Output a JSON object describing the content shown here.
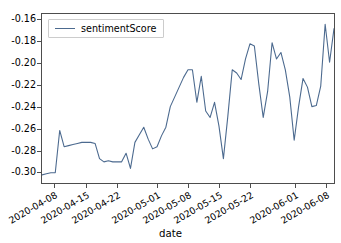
{
  "chart_data": {
    "type": "line",
    "title": "",
    "xlabel": "date",
    "ylabel": "",
    "grid": false,
    "legend_position": "upper left",
    "ylim": [
      -0.3105,
      -0.1545
    ],
    "xlim": [
      "2020-04-05",
      "2020-06-10"
    ],
    "ytick_labels": [
      "-0.16",
      "-0.18",
      "-0.20",
      "-0.22",
      "-0.24",
      "-0.26",
      "-0.28",
      "-0.30"
    ],
    "ytick_values": [
      -0.16,
      -0.18,
      -0.2,
      -0.22,
      -0.24,
      -0.26,
      -0.28,
      -0.3
    ],
    "xtick_labels": [
      "2020-04-08",
      "2020-04-15",
      "2020-04-22",
      "2020-05-01",
      "2020-05-08",
      "2020-05-15",
      "2020-05-22",
      "2020-06-01",
      "2020-06-08"
    ],
    "xtick_dates": [
      "2020-04-08",
      "2020-04-15",
      "2020-04-22",
      "2020-05-01",
      "2020-05-08",
      "2020-05-15",
      "2020-05-22",
      "2020-06-01",
      "2020-06-08"
    ],
    "series": [
      {
        "name": "sentimentScore",
        "color": "#4c6a8f",
        "x": [
          "2020-04-05",
          "2020-04-06",
          "2020-04-07",
          "2020-04-08",
          "2020-04-09",
          "2020-04-10",
          "2020-04-11",
          "2020-04-12",
          "2020-04-13",
          "2020-04-14",
          "2020-04-15",
          "2020-04-16",
          "2020-04-17",
          "2020-04-18",
          "2020-04-19",
          "2020-04-20",
          "2020-04-21",
          "2020-04-22",
          "2020-04-23",
          "2020-04-24",
          "2020-04-25",
          "2020-04-26",
          "2020-04-27",
          "2020-04-28",
          "2020-04-29",
          "2020-04-30",
          "2020-05-01",
          "2020-05-02",
          "2020-05-03",
          "2020-05-04",
          "2020-05-05",
          "2020-05-06",
          "2020-05-07",
          "2020-05-08",
          "2020-05-09",
          "2020-05-10",
          "2020-05-11",
          "2020-05-12",
          "2020-05-13",
          "2020-05-14",
          "2020-05-15",
          "2020-05-16",
          "2020-05-17",
          "2020-05-18",
          "2020-05-19",
          "2020-05-20",
          "2020-05-21",
          "2020-05-22",
          "2020-05-23",
          "2020-05-24",
          "2020-05-25",
          "2020-05-26",
          "2020-05-27",
          "2020-05-28",
          "2020-05-29",
          "2020-05-30",
          "2020-05-31",
          "2020-06-01",
          "2020-06-02",
          "2020-06-03",
          "2020-06-04",
          "2020-06-05",
          "2020-06-06",
          "2020-06-07",
          "2020-06-08",
          "2020-06-09",
          "2020-06-10"
        ],
        "y": [
          -0.303,
          -0.302,
          -0.301,
          -0.301,
          -0.262,
          -0.277,
          -0.276,
          -0.275,
          -0.274,
          -0.273,
          -0.273,
          -0.273,
          -0.274,
          -0.288,
          -0.291,
          -0.29,
          -0.291,
          -0.291,
          -0.291,
          -0.283,
          -0.297,
          -0.273,
          -0.266,
          -0.259,
          -0.27,
          -0.279,
          -0.277,
          -0.267,
          -0.259,
          -0.24,
          -0.231,
          -0.222,
          -0.213,
          -0.206,
          -0.206,
          -0.236,
          -0.212,
          -0.244,
          -0.25,
          -0.236,
          -0.258,
          -0.288,
          -0.249,
          -0.206,
          -0.209,
          -0.215,
          -0.196,
          -0.182,
          -0.184,
          -0.219,
          -0.25,
          -0.226,
          -0.181,
          -0.196,
          -0.19,
          -0.206,
          -0.231,
          -0.271,
          -0.24,
          -0.214,
          -0.222,
          -0.24,
          -0.239,
          -0.221,
          -0.164,
          -0.199,
          -0.168
        ]
      }
    ]
  },
  "axis": {
    "xlabel": "date"
  },
  "legend": {
    "entries": [
      {
        "label": "sentimentScore"
      }
    ]
  }
}
